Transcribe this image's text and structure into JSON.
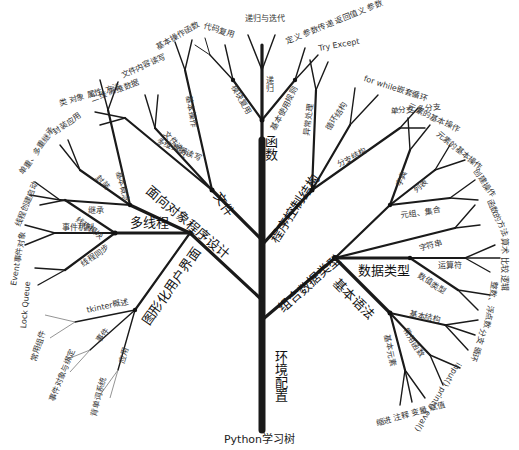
{
  "caption": "Python学习树",
  "trunk": {
    "label": "环境配置"
  },
  "main_branches": [
    {
      "id": "functions",
      "label": "函数",
      "sub": [
        {
          "label": "递归",
          "leaves": "递归与迭代"
        },
        {
          "label": "模块复用",
          "leaves": "代码复用"
        },
        {
          "label": "基本使用规则",
          "leaves": "定义 参数传递 返回值义 参数"
        }
      ]
    },
    {
      "id": "file",
      "label": "文件",
      "sub": [
        {
          "label": "基本操作",
          "leaves": "基本操作函数"
        },
        {
          "label": "文件迭代",
          "leaves": "文件内容读写"
        },
        {
          "label": "多维数据读写",
          "leaves": "二维 高维数据"
        }
      ]
    },
    {
      "id": "control",
      "label": "程序控制结构",
      "sub": [
        {
          "label": "异常处理",
          "leaves": "Try Except"
        },
        {
          "label": "循环结构",
          "leaves": "for while嵌套循环"
        },
        {
          "label": "分支结构",
          "leaves": "单分支 多分支"
        }
      ]
    },
    {
      "id": "oop",
      "label": "面向对象程序设计",
      "sub": [
        {
          "label": "基本概念",
          "leaves": "类 对象 属性 方法"
        },
        {
          "label": "封装",
          "leaves": "封装应用"
        },
        {
          "label": "继承",
          "leaves": "单重、多重继承"
        }
      ]
    },
    {
      "id": "thread",
      "label": "多线程",
      "sub": [
        {
          "label": "线程模块",
          "leaves": "线程创建启动"
        },
        {
          "label": "事件机制",
          "leaves": "Event事件对象"
        },
        {
          "label": "线程同步",
          "leaves": "Lock Queue"
        }
      ]
    },
    {
      "id": "gui",
      "label": "图形化用户界面",
      "sub": [
        {
          "label": "tkinter概述",
          "leaves": "常用组件"
        },
        {
          "label": "事件",
          "leaves": "事件对象与绑定"
        },
        {
          "label": "应用",
          "leaves": "背单词系统"
        }
      ]
    },
    {
      "id": "compound",
      "label": "组合数据类型",
      "sub": [
        {
          "label": "字典",
          "leaves": "元素的基本操作"
        },
        {
          "label": "列表",
          "leaves": "元素的基本操作"
        },
        {
          "label": "元组、集合",
          "leaves": "创建操作"
        },
        {
          "label": "字符串",
          "leaves": "函数的方法"
        }
      ]
    },
    {
      "id": "datatype",
      "label": "数据类型",
      "sub": [
        {
          "label": "运算符",
          "leaves": "算术 比较 逻辑"
        },
        {
          "label": "数值类型",
          "leaves": "整数、浮点数"
        }
      ]
    },
    {
      "id": "syntax",
      "label": "基本语法",
      "sub": [
        {
          "label": "基本结构",
          "leaves": "分支 循环"
        },
        {
          "label": "常用函数",
          "leaves": "input() print() eval()"
        },
        {
          "label": "基本元素",
          "leaves": "缩进 注释 变量 赋值"
        }
      ]
    }
  ]
}
